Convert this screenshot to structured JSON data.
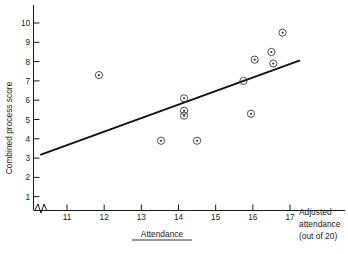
{
  "chart_data": {
    "type": "scatter",
    "title": "",
    "xlabel": "Attendance",
    "xlabel_right": "Adjusted attendance (out of 20)",
    "xlabel_right_lines": [
      "Adjusted",
      "attendance",
      "(out of 20)"
    ],
    "ylabel": "Combined process score",
    "xlim": [
      10.3,
      17.6
    ],
    "ylim": [
      0,
      10.6
    ],
    "xticks": [
      11,
      12,
      13,
      14,
      15,
      16,
      17
    ],
    "yticks": [
      1,
      2,
      3,
      4,
      5,
      6,
      7,
      8,
      9,
      10
    ],
    "xtick_labels": [
      "11",
      "12",
      "13",
      "14",
      "15",
      "16",
      "17"
    ],
    "ytick_labels": [
      "1",
      "2",
      "3",
      "4",
      "5",
      "6",
      "7",
      "8",
      "9",
      "10"
    ],
    "grid": false,
    "legend": "none",
    "axis_break": true,
    "marker_style": "circle-with-dot",
    "points": [
      {
        "x": 11.86,
        "y": 7.3
      },
      {
        "x": 13.53,
        "y": 3.9
      },
      {
        "x": 14.15,
        "y": 6.1
      },
      {
        "x": 14.15,
        "y": 5.45
      },
      {
        "x": 14.15,
        "y": 5.2
      },
      {
        "x": 14.5,
        "y": 3.9
      },
      {
        "x": 15.75,
        "y": 7.0
      },
      {
        "x": 15.95,
        "y": 5.3
      },
      {
        "x": 16.05,
        "y": 8.1
      },
      {
        "x": 16.5,
        "y": 8.5
      },
      {
        "x": 16.55,
        "y": 7.9
      },
      {
        "x": 16.8,
        "y": 9.5
      }
    ],
    "fit_line": {
      "kind": "linear-regression",
      "x_start": 10.3,
      "y_start": 3.18,
      "x_end": 17.25,
      "y_end": 8.05
    }
  },
  "axes": {
    "x_axis_name": "attendance-axis",
    "y_axis_name": "combined-process-score-axis"
  }
}
